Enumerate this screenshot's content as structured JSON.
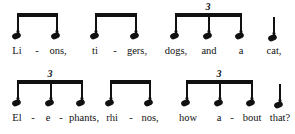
{
  "document": {
    "type": "music-notation-rhythm-exercise",
    "system_count": 2,
    "note_color": "#111111",
    "background_color": "#ffffff"
  },
  "systems": [
    {
      "id": "system-1",
      "groups": [
        {
          "id": "group-1-1",
          "beamed": true,
          "triplet": false,
          "triplet_label": "",
          "notes": [
            {
              "lyric": "Li",
              "hyphen_after": true
            },
            {
              "lyric": "ons,",
              "hyphen_after": false
            }
          ]
        },
        {
          "id": "group-1-2",
          "beamed": true,
          "triplet": false,
          "triplet_label": "",
          "notes": [
            {
              "lyric": "ti",
              "hyphen_after": true
            },
            {
              "lyric": "gers,",
              "hyphen_after": false
            }
          ]
        },
        {
          "id": "group-1-3",
          "beamed": true,
          "triplet": true,
          "triplet_label": "3",
          "notes": [
            {
              "lyric": "dogs,",
              "hyphen_after": false
            },
            {
              "lyric": "and",
              "hyphen_after": false
            },
            {
              "lyric": "a",
              "hyphen_after": false
            }
          ]
        },
        {
          "id": "group-1-4",
          "beamed": false,
          "triplet": false,
          "triplet_label": "",
          "notes": [
            {
              "lyric": "cat,",
              "hyphen_after": false
            }
          ]
        }
      ]
    },
    {
      "id": "system-2",
      "groups": [
        {
          "id": "group-2-1",
          "beamed": true,
          "triplet": true,
          "triplet_label": "3",
          "notes": [
            {
              "lyric": "El",
              "hyphen_after": true
            },
            {
              "lyric": "e",
              "hyphen_after": true
            },
            {
              "lyric": "phants,",
              "hyphen_after": false
            }
          ]
        },
        {
          "id": "group-2-2",
          "beamed": true,
          "triplet": false,
          "triplet_label": "",
          "notes": [
            {
              "lyric": "rhi",
              "hyphen_after": true
            },
            {
              "lyric": "nos,",
              "hyphen_after": false
            }
          ]
        },
        {
          "id": "group-2-3",
          "beamed": true,
          "triplet": true,
          "triplet_label": "3",
          "notes": [
            {
              "lyric": "how",
              "hyphen_after": false
            },
            {
              "lyric": "a",
              "hyphen_after": true
            },
            {
              "lyric": "bout",
              "hyphen_after": false
            }
          ]
        },
        {
          "id": "group-2-4",
          "beamed": false,
          "triplet": false,
          "triplet_label": "",
          "notes": [
            {
              "lyric": "that?",
              "hyphen_after": false
            }
          ]
        }
      ]
    }
  ],
  "layout": {
    "note_x": [
      [
        17,
        57,
        95,
        136,
        175,
        208,
        241,
        273
      ],
      [
        17,
        50,
        82,
        110,
        150,
        186,
        219,
        252,
        275
      ]
    ]
  }
}
